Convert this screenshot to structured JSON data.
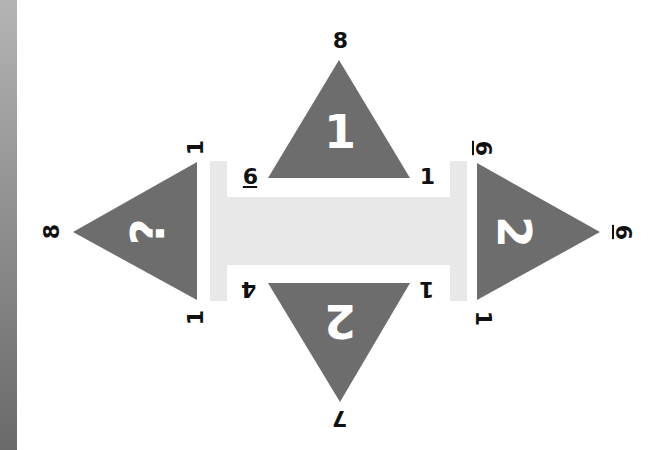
{
  "colors": {
    "triangle_fill": "#6d6d6d",
    "beam_fill": "#e8e8e8",
    "label_color": "#111111",
    "center_label_color": "#ffffff"
  },
  "triangles": {
    "top": {
      "center": "1",
      "apex": "8",
      "left": "6",
      "right": "1"
    },
    "right": {
      "center": "2",
      "apex": "6",
      "top": "6",
      "bottom": "1"
    },
    "bottom": {
      "center": "2",
      "apex": "7",
      "left": "4",
      "right": "1"
    },
    "left": {
      "center": "?",
      "apex": "8",
      "top": "1",
      "bottom": "1"
    }
  }
}
